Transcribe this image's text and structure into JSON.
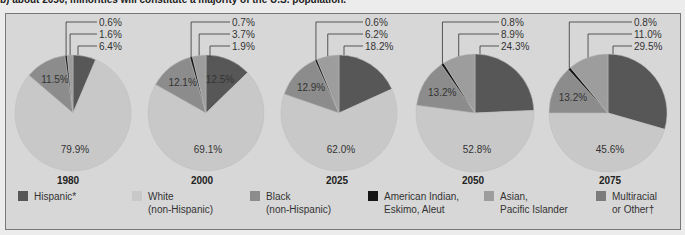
{
  "caption": "b) about 2050, minorities will constitute a majority of the U.S. population.",
  "colors": {
    "hispanic": "#575757",
    "white": "#c8c8c8",
    "black": "#8c8c8c",
    "american_indian": "#151515",
    "asian": "#9d9d9d",
    "multiracial": "#7c7c7c",
    "background": "#d7d7d7"
  },
  "legend": [
    {
      "key": "hispanic",
      "label": "Hispanic*"
    },
    {
      "key": "white",
      "label": "White\n(non-Hispanic)"
    },
    {
      "key": "black",
      "label": "Black\n(non-Hispanic)"
    },
    {
      "key": "american_indian",
      "label": "American Indian,\nEskimo, Aleut"
    },
    {
      "key": "asian",
      "label": "Asian,\nPacific Islander"
    },
    {
      "key": "multiracial",
      "label": "Multiracial\nor Other†"
    }
  ],
  "chart_data": [
    {
      "type": "pie",
      "title": "1980",
      "categories": [
        "Hispanic",
        "White (non-Hispanic)",
        "Black (non-Hispanic)",
        "American Indian, Eskimo, Aleut",
        "Asian, Pacific Islander"
      ],
      "values": [
        6.4,
        79.9,
        11.5,
        0.6,
        1.6
      ],
      "labels": [
        "6.4%",
        "79.9%",
        "11.5%",
        "0.6%",
        "1.6%"
      ]
    },
    {
      "type": "pie",
      "title": "2000",
      "categories": [
        "Hispanic",
        "White (non-Hispanic)",
        "Black (non-Hispanic)",
        "American Indian, Eskimo, Aleut",
        "Asian, Pacific Islander"
      ],
      "values": [
        12.5,
        69.1,
        12.1,
        0.7,
        3.7
      ],
      "labels": [
        "12.5%",
        "69.1%",
        "12.1%",
        "0.7%",
        "3.7%"
      ],
      "extra_label": "1.9%"
    },
    {
      "type": "pie",
      "title": "2025",
      "categories": [
        "Hispanic",
        "White (non-Hispanic)",
        "Black (non-Hispanic)",
        "American Indian, Eskimo, Aleut",
        "Asian, Pacific Islander"
      ],
      "values": [
        18.2,
        62.0,
        12.9,
        0.6,
        6.2
      ],
      "labels": [
        "18.2%",
        "62.0%",
        "12.9%",
        "0.6%",
        "6.2%"
      ]
    },
    {
      "type": "pie",
      "title": "2050",
      "categories": [
        "Hispanic",
        "White (non-Hispanic)",
        "Black (non-Hispanic)",
        "American Indian, Eskimo, Aleut",
        "Asian, Pacific Islander"
      ],
      "values": [
        24.3,
        52.8,
        13.2,
        0.8,
        8.9
      ],
      "labels": [
        "24.3%",
        "52.8%",
        "13.2%",
        "0.8%",
        "8.9%"
      ]
    },
    {
      "type": "pie",
      "title": "2075",
      "categories": [
        "Hispanic",
        "White (non-Hispanic)",
        "Black (non-Hispanic)",
        "American Indian, Eskimo, Aleut",
        "Asian, Pacific Islander"
      ],
      "values": [
        29.5,
        45.6,
        13.2,
        0.8,
        11.0
      ],
      "labels": [
        "29.5%",
        "45.6%",
        "13.2%",
        "0.8%",
        "11.0%"
      ]
    }
  ],
  "layout": {
    "pies": [
      {
        "cx": 73,
        "cy": 113,
        "r": 58,
        "year_x": 68
      },
      {
        "cx": 206,
        "cy": 113,
        "r": 58,
        "year_x": 202
      },
      {
        "cx": 339,
        "cy": 113,
        "r": 58,
        "year_x": 337
      },
      {
        "cx": 475,
        "cy": 113,
        "r": 59,
        "year_x": 473
      },
      {
        "cx": 608,
        "cy": 113,
        "r": 59,
        "year_x": 610
      }
    ],
    "legend_x": [
      18,
      132,
      250,
      368,
      484,
      596
    ]
  }
}
